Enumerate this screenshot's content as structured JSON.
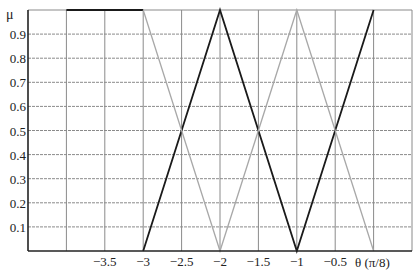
{
  "chart_data": {
    "type": "line",
    "title": "",
    "xlabel": "θ (π/8)",
    "ylabel": "μ",
    "xlim": [
      -4.5,
      0.5
    ],
    "ylim": [
      0,
      1.0
    ],
    "grid": true,
    "x_ticks": [
      -3.5,
      -3,
      -2.5,
      -2,
      -1.5,
      -1,
      -0.5
    ],
    "x_tick_labels": [
      "−3.5",
      "−3",
      "−2.5",
      "−2",
      "−1.5",
      "−1",
      "−0.5"
    ],
    "y_ticks": [
      0.1,
      0.2,
      0.3,
      0.4,
      0.5,
      0.6,
      0.7,
      0.8,
      0.9
    ],
    "y_tick_labels": [
      "0.1",
      "0.2",
      "0.3",
      "0.4",
      "0.5",
      "0.6",
      "0.7",
      "0.8",
      "0.9"
    ],
    "series": [
      {
        "name": "dark-plateau",
        "color": "#1a1a1a",
        "x": [
          -4,
          -3
        ],
        "y": [
          1,
          1
        ]
      },
      {
        "name": "dark-triangles",
        "color": "#1a1a1a",
        "x": [
          -3,
          -2,
          -1,
          0
        ],
        "y": [
          0,
          1,
          0,
          1
        ]
      },
      {
        "name": "gray-triangles",
        "color": "#a8a8a8",
        "x": [
          -3,
          -2,
          -1,
          0
        ],
        "y": [
          1,
          0,
          1,
          0
        ]
      }
    ],
    "legend": null
  },
  "colors": {
    "grid": "#8a8a8a",
    "axis": "#222222",
    "dark_series": "#1a1a1a",
    "gray_series": "#a8a8a8"
  }
}
